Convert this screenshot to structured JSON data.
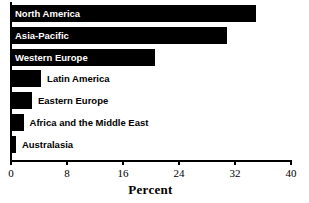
{
  "chart_data": {
    "type": "bar",
    "orientation": "horizontal",
    "title": "",
    "xlabel": "Percent",
    "ylabel": "",
    "xlim": [
      0,
      40
    ],
    "xticks": [
      0,
      8,
      16,
      24,
      32,
      40
    ],
    "xtick_labels": [
      "0",
      "8",
      "16",
      "24",
      "32",
      "40"
    ],
    "grid": false,
    "legend": null,
    "bar_color": "#000000",
    "background_color": "#ffffff",
    "categories": [
      "North America",
      "Asia-Pacific",
      "Western Europe",
      "Latin America",
      "Eastern Europe",
      "Africa and the Middle East",
      "Australasia"
    ],
    "values": [
      35.0,
      30.8,
      20.5,
      4.3,
      3.0,
      1.8,
      0.7
    ],
    "label_placement": [
      "inside",
      "inside",
      "inside",
      "outside",
      "outside",
      "outside",
      "outside"
    ]
  }
}
